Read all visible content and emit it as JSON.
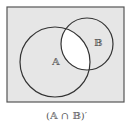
{
  "diagram": {
    "type": "venn",
    "universe": {
      "x": 7,
      "y": 7,
      "width": 117,
      "height": 95,
      "fill": "#e6e6e6",
      "stroke": "#555555"
    },
    "sets": [
      {
        "id": "A",
        "label": "𝔸",
        "cx": 55,
        "cy": 62,
        "r": 35,
        "label_x": 52,
        "label_y": 65
      },
      {
        "id": "B",
        "label": "𝔹",
        "cx": 87,
        "cy": 44,
        "r": 26,
        "label_x": 94,
        "label_y": 46
      }
    ],
    "shaded_region": "complement of A ∩ B",
    "intersection_fill": "#ffffff",
    "caption": "(𝔸 ∩ 𝔹)′"
  }
}
